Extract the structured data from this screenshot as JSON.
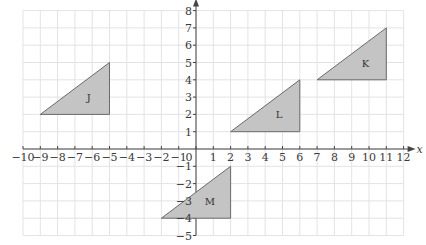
{
  "diagram": {
    "type": "coordinate-plane",
    "x_axis": {
      "label": "x",
      "min": -10,
      "max": 12,
      "ticks": [
        -10,
        -9,
        -8,
        -7,
        -6,
        -5,
        -4,
        -3,
        -2,
        -1,
        0,
        1,
        2,
        3,
        4,
        5,
        6,
        7,
        8,
        9,
        10,
        11,
        12
      ]
    },
    "y_axis": {
      "label": "y",
      "min": -5,
      "max": 8,
      "ticks": [
        -5,
        -4,
        -3,
        -2,
        -1,
        1,
        2,
        3,
        4,
        5,
        6,
        7,
        8
      ]
    },
    "origin_label": "0",
    "colors": {
      "grid": "#e3e3e3",
      "axis": "#444444",
      "fill": "#c4c4c4",
      "stroke": "#6a6a6a"
    },
    "shapes": [
      {
        "label": "J",
        "vertices": [
          [
            -9,
            2
          ],
          [
            -5,
            2
          ],
          [
            -5,
            5
          ]
        ],
        "label_pos": [
          -6.2,
          3
        ]
      },
      {
        "label": "K",
        "vertices": [
          [
            7,
            4
          ],
          [
            11,
            4
          ],
          [
            11,
            7
          ]
        ],
        "label_pos": [
          9.8,
          5
        ]
      },
      {
        "label": "L",
        "vertices": [
          [
            2,
            1
          ],
          [
            6,
            1
          ],
          [
            6,
            4
          ]
        ],
        "label_pos": [
          4.8,
          2
        ]
      },
      {
        "label": "M",
        "vertices": [
          [
            -2,
            -4
          ],
          [
            2,
            -4
          ],
          [
            2,
            -1
          ]
        ],
        "label_pos": [
          0.8,
          -3
        ]
      }
    ]
  }
}
